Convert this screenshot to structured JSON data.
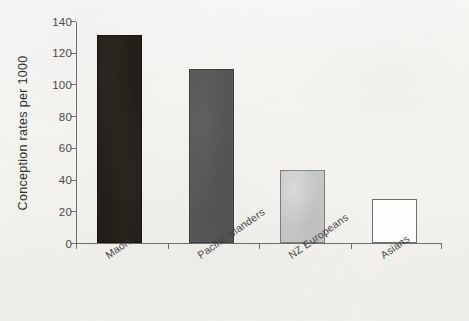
{
  "chart_data": {
    "type": "bar",
    "title": "",
    "xlabel": "",
    "ylabel": "Conception rates per 1000",
    "categories": [
      "Maori",
      "Pacific islanders",
      "NZ Europeans",
      "Asians"
    ],
    "values": [
      131,
      110,
      46,
      28
    ],
    "series": [
      {
        "name": "Conception rates per 1000",
        "values": [
          131,
          110,
          46,
          28
        ]
      }
    ],
    "ylim": [
      0,
      140
    ],
    "ytick_labels": [
      "0",
      "20",
      "40",
      "60",
      "80",
      "100",
      "120",
      "140"
    ],
    "ytick_values": [
      0,
      20,
      40,
      60,
      80,
      100,
      120,
      140
    ],
    "grid": false,
    "legend": "none",
    "bar_colors": [
      "#241e18",
      "#565656",
      "#c5c5c5",
      "#fdfdfc"
    ],
    "axis_color": "#6f6f6f",
    "background_color": "#f8f6f3",
    "category_label_rotation_deg": -35
  },
  "axis": {
    "y_title": "Conception rates per 1000"
  }
}
